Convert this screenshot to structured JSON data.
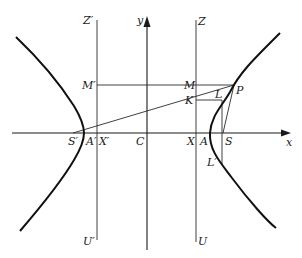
{
  "figure": {
    "type": "hyperbola-construction"
  },
  "labels": {
    "x_axis": "x",
    "y_axis": "y",
    "Z_prime": "Z′",
    "Z": "Z",
    "M_prime": "M′",
    "M": "M",
    "K": "K",
    "L": "L",
    "P": "P",
    "S_prime": "S′",
    "A_prime": "A′",
    "X_prime": "X′",
    "C": "C",
    "X": "X",
    "A": "A",
    "S": "S",
    "L_prime": "L′",
    "U_prime": "U′",
    "U": "U"
  },
  "points": {
    "C": [
      147,
      133
    ],
    "S": [
      223,
      133
    ],
    "S_prime": [
      73,
      133
    ],
    "A": [
      210,
      133
    ],
    "A_prime": [
      84,
      133
    ],
    "X": [
      196,
      133
    ],
    "X_prime": [
      97,
      133
    ],
    "P": [
      234,
      85
    ],
    "M": [
      196,
      85
    ],
    "M_prime": [
      97,
      85
    ],
    "K": [
      196,
      100
    ],
    "L": [
      222,
      100
    ],
    "L_prime": [
      222,
      165
    ]
  },
  "colors": {
    "background": "#ffffff",
    "ink": "#1a1a1a"
  }
}
